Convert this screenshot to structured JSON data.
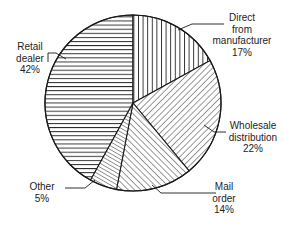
{
  "figure": {
    "title_fragment": "",
    "background": "#ffffff",
    "stroke": "#1a1a1a"
  },
  "chart_data": {
    "type": "pie",
    "title": "",
    "xlabel": "",
    "ylabel": "",
    "legend_position": "callout-labels",
    "grid": false,
    "start_angle_deg": 0,
    "direction": "clockwise",
    "categories": [
      "Direct from manufacturer",
      "Wholesale distribution",
      "Mail order",
      "Other",
      "Retail dealer"
    ],
    "values": [
      17,
      22,
      14,
      5,
      42
    ],
    "unit": "%",
    "slices": [
      {
        "id": "direct-from-manufacturer",
        "label_lines": [
          "Direct",
          "from",
          "manufacturer"
        ],
        "value": 17,
        "value_text": "17%",
        "hatch": "vertical",
        "fill": "#ffffff",
        "stroke": "#1a1a1a",
        "start_deg": 0,
        "end_deg": 61.2
      },
      {
        "id": "wholesale-distribution",
        "label_lines": [
          "Wholesale",
          "distribution"
        ],
        "value": 22,
        "value_text": "22%",
        "hatch": "diagonal-back",
        "fill": "#ffffff",
        "stroke": "#1a1a1a",
        "start_deg": 61.2,
        "end_deg": 140.4
      },
      {
        "id": "mail-order",
        "label_lines": [
          "Mail",
          "order"
        ],
        "value": 14,
        "value_text": "14%",
        "hatch": "diagonal-forward",
        "fill": "#ffffff",
        "stroke": "#1a1a1a",
        "start_deg": 140.4,
        "end_deg": 190.8
      },
      {
        "id": "other",
        "label_lines": [
          "Other"
        ],
        "value": 5,
        "value_text": "5%",
        "hatch": "diagonal-forward-dense",
        "fill": "#ffffff",
        "stroke": "#1a1a1a",
        "start_deg": 190.8,
        "end_deg": 208.8
      },
      {
        "id": "retail-dealer",
        "label_lines": [
          "Retail",
          "dealer"
        ],
        "value": 42,
        "value_text": "42%",
        "hatch": "horizontal",
        "fill": "#ffffff",
        "stroke": "#1a1a1a",
        "start_deg": 208.8,
        "end_deg": 360
      }
    ]
  },
  "labels": {
    "direct": {
      "l1": "Direct",
      "l2": "from",
      "l3": "manufacturer",
      "pct": "17%"
    },
    "wholesale": {
      "l1": "Wholesale",
      "l2": "distribution",
      "pct": "22%"
    },
    "mail": {
      "l1": "Mail",
      "l2": "order",
      "pct": "14%"
    },
    "other": {
      "l1": "Other",
      "pct": "5%"
    },
    "retail": {
      "l1": "Retail",
      "l2": "dealer",
      "pct": "42%"
    }
  }
}
